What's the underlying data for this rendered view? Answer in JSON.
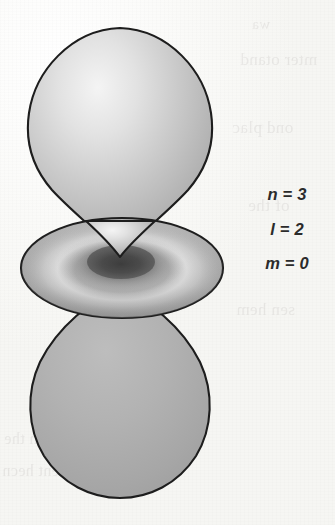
{
  "figure": {
    "kind": "atomic-orbital-illustration",
    "orbital_label": "3d z-squared orbital",
    "background_color": "#f7f7f4",
    "outline_color": "#1d1d1d",
    "lobe_fill_light": "#efefef",
    "lobe_fill_mid": "#b4b4b4",
    "lobe_fill_dark": "#9a9a9a",
    "torus_shadow_color": "#343434",
    "torus_highlight_color": "#e6e6e6"
  },
  "quantum_numbers": {
    "lines": [
      {
        "name": "principal-quantum-number",
        "text": "n = 3"
      },
      {
        "name": "azimuthal-quantum-number",
        "text": "l = 2"
      },
      {
        "name": "magnetic-quantum-number",
        "text": "m = 0"
      }
    ]
  },
  "shapes": {
    "upper_lobe": {
      "name": "upper-teardrop-lobe",
      "apex_x": 120,
      "apex_y": 257,
      "top_y": 27,
      "left_x": 27,
      "right_x": 213,
      "widest_y": 115
    },
    "torus": {
      "name": "equatorial-torus",
      "center_x": 122,
      "center_y": 268,
      "left_x": 22,
      "right_x": 224,
      "top_y": 218,
      "bottom_y": 318,
      "radius_x": 101,
      "radius_y": 50
    },
    "lower_lobe": {
      "name": "lower-teardrop-lobe",
      "apex_x": 120,
      "apex_y": 288,
      "bottom_y": 497,
      "left_x": 33,
      "right_x": 211,
      "widest_y": 410
    }
  },
  "ghost_marks": {
    "items": [
      "mter otand",
      "ond plac",
      "of the",
      "sen hem",
      "tahn the",
      "ifferent hecn",
      "wa"
    ]
  }
}
